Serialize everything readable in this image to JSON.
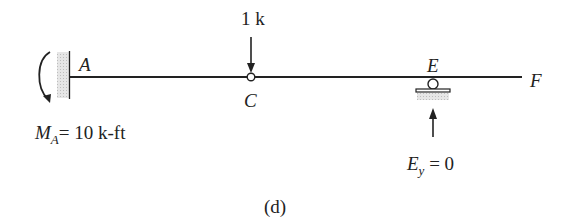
{
  "diagram": {
    "caption": "(d)",
    "load": {
      "label": "1 k",
      "point": "C"
    },
    "points": {
      "A": "A",
      "C": "C",
      "E": "E",
      "F": "F"
    },
    "moment_reaction": {
      "symbol": "M",
      "subscript": "A",
      "value_text": "= 10 k-ft"
    },
    "vertical_reaction": {
      "symbol": "E",
      "subscript": "y",
      "value_text": " = 0"
    },
    "supports": {
      "A": "fixed",
      "C": "hinge",
      "E": "roller"
    },
    "colors": {
      "line": "#222222",
      "hatch": "#d8d8d8"
    }
  }
}
